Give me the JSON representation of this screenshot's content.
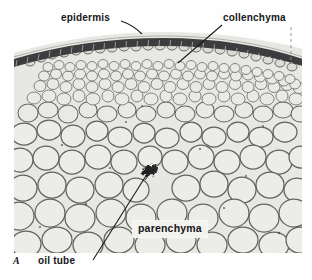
{
  "figure": {
    "panel_letter": "A",
    "caption_labels": {
      "epidermis": "epidermis",
      "collenchyma": "collenchyma",
      "parenchyma": "parenchyma",
      "oil_tube": "oil tube"
    },
    "colors": {
      "background": "#ffffff",
      "plate_light": "#e8e8e4",
      "plate_mid": "#cfcfc9",
      "cell_wall": "#6b6b66",
      "epidermis_dark": "#2e2e2c",
      "text": "#16161a",
      "label_box": "#f2f2ef"
    },
    "leaders": [
      {
        "name": "epidermis-leader",
        "x1": 122,
        "y1": 22,
        "x2": 141,
        "y2": 33
      },
      {
        "name": "collenchyma-leader",
        "x1": 222,
        "y1": 24,
        "x2": 178,
        "y2": 63
      },
      {
        "name": "epidermis-dashed-leader",
        "x1": 291,
        "y1": 28,
        "x2": 291,
        "y2": 60
      },
      {
        "name": "oil-tube-leader",
        "x1": 94,
        "y1": 259,
        "x2": 148,
        "y2": 171
      }
    ],
    "oil_tube_marker": {
      "cx": 150,
      "cy": 170
    }
  }
}
